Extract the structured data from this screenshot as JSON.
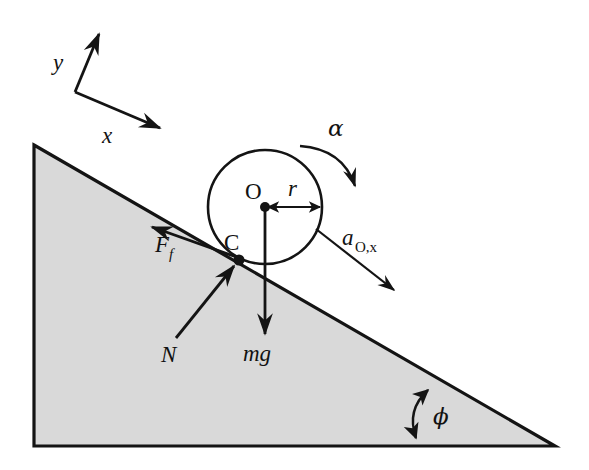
{
  "figure": {
    "type": "physics-free-body-diagram",
    "background_color": "#ffffff",
    "ink_color": "#141414",
    "incline_fill_color": "#d9d9d9"
  },
  "labels": {
    "axis_y": "y",
    "axis_x": "x",
    "center": "O",
    "radius": "r",
    "contact_point": "C",
    "friction_base": "F",
    "friction_sub": "f",
    "normal_force": "N",
    "weight": "mg",
    "angular_accel": "α",
    "accel_base": "a",
    "accel_sub": "O,x",
    "incline_angle": "ϕ"
  },
  "geometry": {
    "incline": {
      "apex": [
        34,
        145
      ],
      "bottom_left": [
        34,
        446
      ],
      "bottom_right": [
        555,
        446
      ],
      "angle_degrees": 30
    },
    "circle": {
      "center": [
        265,
        207
      ],
      "radius": 57
    },
    "contact_point": [
      239,
      260
    ],
    "axes_origin": [
      75,
      92
    ],
    "axis_y_tip": [
      101,
      30
    ],
    "axis_x_tip": [
      163,
      131
    ]
  },
  "vectors": [
    {
      "name": "friction",
      "label": "F_f",
      "from": [
        239,
        260
      ],
      "to": [
        150,
        225
      ],
      "style": "single-arrow"
    },
    {
      "name": "normal",
      "label": "N",
      "from": [
        176,
        338
      ],
      "to": [
        236,
        264
      ],
      "style": "single-arrow"
    },
    {
      "name": "weight",
      "label": "mg",
      "from": [
        265,
        207
      ],
      "to": [
        265,
        336
      ],
      "style": "single-arrow"
    },
    {
      "name": "radius",
      "label": "r",
      "from": [
        265,
        207
      ],
      "to": [
        322,
        207
      ],
      "style": "double-arrow"
    },
    {
      "name": "acceleration",
      "label": "a_O,x",
      "from": [
        318,
        231
      ],
      "to": [
        396,
        291
      ],
      "style": "single-arrow"
    },
    {
      "name": "angular-acceleration",
      "label": "alpha",
      "style": "curved-arrow-clockwise"
    },
    {
      "name": "incline-angle",
      "label": "phi",
      "style": "double-curved-arrow"
    }
  ]
}
